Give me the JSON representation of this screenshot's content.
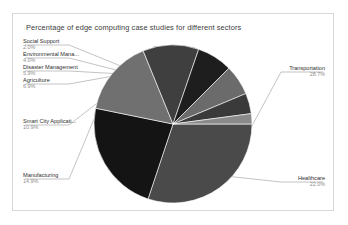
{
  "chart_data": {
    "type": "pie",
    "title": "Percentage of edge computing case studies for different sectors",
    "xlabel": "",
    "ylabel": "",
    "legend_position": "none",
    "labels_position": "outside-with-leader-lines",
    "categories": [
      "Transportation",
      "Healthcare",
      "Manufacturing",
      "Smart City Applicati...",
      "Agriculture",
      "Disaster Management",
      "Environmental Mana...",
      "Social Support"
    ],
    "values": [
      28.7,
      22.0,
      14.9,
      10.9,
      6.9,
      5.9,
      4.0,
      2.0
    ],
    "value_labels": [
      "28.7%",
      "22.0%",
      "14.9%",
      "10.9%",
      "6.9%",
      "5.9%",
      "4.0%",
      "2.0%"
    ],
    "colors": [
      "#4a4a4a",
      "#141414",
      "#707070",
      "#3f3f3f",
      "#1e1e1e",
      "#6b6b6b",
      "#3a3a3a",
      "#8a8a8a"
    ],
    "start_angle_deg": 0,
    "direction": "clockwise"
  },
  "panel": {
    "title": "Percentage of edge computing case studies for different sectors",
    "border_color": "#d8d8d8",
    "background": "#ffffff"
  },
  "slices": [
    {
      "name": "Transportation",
      "pct": "28.7%",
      "color": "#4a4a4a"
    },
    {
      "name": "Healthcare",
      "pct": "22.0%",
      "color": "#141414"
    },
    {
      "name": "Manufacturing",
      "pct": "14.9%",
      "color": "#707070"
    },
    {
      "name": "Smart City Applicati...",
      "pct": "10.9%",
      "color": "#3f3f3f"
    },
    {
      "name": "Agriculture",
      "pct": "6.9%",
      "color": "#1e1e1e"
    },
    {
      "name": "Disaster Management",
      "pct": "5.9%",
      "color": "#6b6b6b"
    },
    {
      "name": "Environmental Mana...",
      "pct": "4.0%",
      "color": "#3a3a3a"
    },
    {
      "name": "Social Support",
      "pct": "2.0%",
      "color": "#8a8a8a"
    }
  ]
}
